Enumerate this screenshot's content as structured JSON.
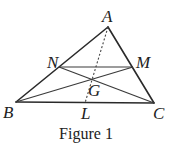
{
  "figure": {
    "caption": "Figure 1",
    "points": {
      "A": {
        "label": "A",
        "x": 108,
        "y": 27
      },
      "B": {
        "label": "B",
        "x": 16,
        "y": 102
      },
      "C": {
        "label": "C",
        "x": 154,
        "y": 103
      },
      "N": {
        "label": "N",
        "x": 59,
        "y": 67
      },
      "M": {
        "label": "M",
        "x": 133,
        "y": 67
      },
      "G": {
        "label": "G",
        "x": 93,
        "y": 80
      },
      "L": {
        "label": "L",
        "x": 85,
        "y": 103
      }
    },
    "segments": [
      {
        "from": "A",
        "to": "B",
        "style": "solid"
      },
      {
        "from": "A",
        "to": "C",
        "style": "solid"
      },
      {
        "from": "B",
        "to": "C",
        "style": "solid"
      },
      {
        "from": "N",
        "to": "M",
        "style": "solid"
      },
      {
        "from": "N",
        "to": "C",
        "style": "solid"
      },
      {
        "from": "B",
        "to": "M",
        "style": "solid"
      },
      {
        "from": "A",
        "to": "L",
        "style": "dashed"
      }
    ]
  }
}
